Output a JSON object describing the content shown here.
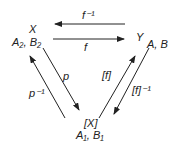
{
  "nodes": {
    "x": {
      "name": "X",
      "attrs": "A₂, B₂"
    },
    "y": {
      "name": "Y",
      "attrs": "A, B"
    },
    "qx": {
      "name": "[X]",
      "attrs": "A₁, B₁"
    }
  },
  "edges": {
    "f_inv": "f⁻¹",
    "f": "f",
    "p": "p",
    "p_inv": "p⁻¹",
    "bf": "[f]",
    "bf_inv": "[f]⁻¹"
  },
  "colors": {
    "stroke": "#222222",
    "background": "#ffffff"
  }
}
